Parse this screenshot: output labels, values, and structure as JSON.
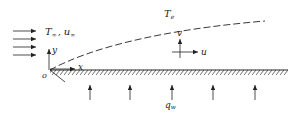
{
  "diagram": {
    "type": "boundary-layer-flat-plate-heat-flux",
    "colors": {
      "stroke": "#222222",
      "background": "#ffffff"
    },
    "freestream": {
      "label_T": "T",
      "label_T_sub": "∞",
      "separator": ",",
      "label_u": "u",
      "label_u_sub": "∞",
      "arrow_count": 4
    },
    "edge": {
      "label": "T",
      "label_sub": "e",
      "line_style": "dashed"
    },
    "axes": {
      "origin": "o",
      "x": "x",
      "y": "y"
    },
    "velocity_components": {
      "v": "v",
      "u": "u"
    },
    "wall": {
      "heat_flux_label": "q",
      "heat_flux_sub": "w",
      "heat_arrow_count": 5
    }
  }
}
